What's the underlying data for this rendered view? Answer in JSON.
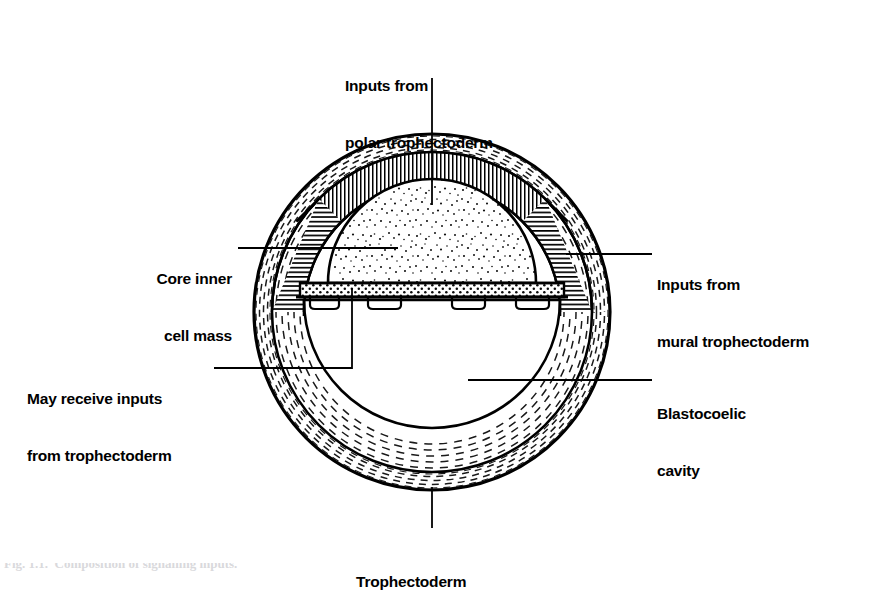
{
  "figure": {
    "type": "biological-diagram",
    "background_color": "#ffffff",
    "ink_color": "#000000"
  },
  "labels": {
    "polar_inputs": {
      "line1": "Inputs from",
      "line2": "polar trophectoderm",
      "x": 345,
      "y": 38,
      "align": "left"
    },
    "core_icm": {
      "line1": "Core inner",
      "line2": "cell mass",
      "x": 98,
      "y": 231,
      "align": "right"
    },
    "mural_inputs": {
      "line1": "Inputs from",
      "line2": "mural trophectoderm",
      "x": 655,
      "y": 237,
      "align": "left"
    },
    "may_receive": {
      "line1": "May receive inputs",
      "line2": "from trophectoderm",
      "x": 28,
      "y": 351,
      "align": "left"
    },
    "blastocoelic": {
      "line1": "Blastocoelic",
      "line2": "cavity",
      "x": 655,
      "y": 366,
      "align": "left"
    },
    "trophectoderm": {
      "line1": "Trophectoderm",
      "x": 355,
      "y": 534,
      "align": "left"
    }
  },
  "caption": {
    "text": "Fig. 1.1.  Composition of signalling inputs."
  },
  "geometry": {
    "center_x": 432,
    "center_y": 312,
    "zona_outer_radius": 178,
    "zona_inner_radius": 168,
    "troph_outer_radius": 160,
    "troph_inner_radius": 128,
    "icm_dome_radius": 104,
    "endoderm_line_y": 283,
    "cavity_top_y": 297
  },
  "regions": [
    {
      "name": "zona-pellucida",
      "pattern": "radial-dashes"
    },
    {
      "name": "polar-trophectoderm",
      "pattern": "vertical-hatch"
    },
    {
      "name": "mural-trophectoderm",
      "pattern": "horizontal-hatch"
    },
    {
      "name": "inner-cell-mass-core",
      "pattern": "sparse-stipple"
    },
    {
      "name": "primitive-endoderm",
      "pattern": "dense-dot-grid"
    },
    {
      "name": "blastocoelic-cavity",
      "pattern": "blank"
    }
  ],
  "leaders": [
    {
      "name": "polar-leader",
      "from_x": 432,
      "from_y": 78,
      "to_x": 432,
      "to_y": 205
    },
    {
      "name": "core-icm-leader",
      "from_x": 238,
      "from_y": 248,
      "to_x": 395,
      "to_y": 248
    },
    {
      "name": "mural-leader",
      "from_x": 570,
      "from_y": 254,
      "to_x": 650,
      "to_y": 254
    },
    {
      "name": "may-receive-leader-h",
      "from_x": 218,
      "from_y": 368,
      "to_x": 352,
      "to_y": 368
    },
    {
      "name": "may-receive-leader-v",
      "from_x": 352,
      "from_y": 368,
      "to_x": 352,
      "to_y": 288
    },
    {
      "name": "blastocoel-leader",
      "from_x": 470,
      "from_y": 380,
      "to_x": 650,
      "to_y": 380
    },
    {
      "name": "trophectoderm-leader",
      "from_x": 432,
      "from_y": 485,
      "to_x": 432,
      "to_y": 528
    }
  ]
}
